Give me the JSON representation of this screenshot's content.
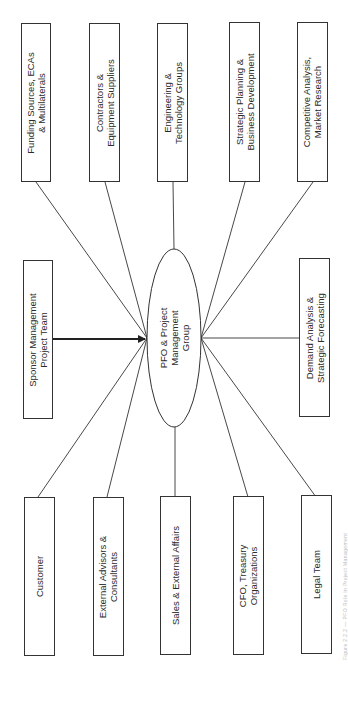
{
  "diagram": {
    "hub": {
      "label": "PFO & Project\nManagement\nGroup"
    },
    "top_nodes": [
      {
        "id": "funding",
        "label": "Funding Sources, ECAs\n& Multilaterals"
      },
      {
        "id": "contractors",
        "label": "Contractors &\nEquipment Suppliers"
      },
      {
        "id": "engineering",
        "label": "Engineering &\nTechnology Groups"
      },
      {
        "id": "strategic",
        "label": "Strategic Planning &\nBusiness Development"
      },
      {
        "id": "competitive",
        "label": "Competitive Analysis,\nMarket Research"
      }
    ],
    "middle_nodes": [
      {
        "id": "sponsor",
        "label": "Sponsor Management\nProject Team",
        "connection": "arrow-to-hub"
      },
      {
        "id": "demand",
        "label": "Demand Analysis &\nStrategic Forecasting",
        "connection": "line"
      }
    ],
    "bottom_nodes": [
      {
        "id": "customer",
        "label": "Customer"
      },
      {
        "id": "advisors",
        "label": "External Advisors &\nConsultants"
      },
      {
        "id": "sales",
        "label": "Sales & External Affairs"
      },
      {
        "id": "cfo",
        "label": "CFO, Treasury\nOrganizations"
      },
      {
        "id": "legal",
        "label": "Legal Team"
      }
    ],
    "caption": "Figure 2.2.2 — PFO Role in Project Management",
    "orientation": "rotated 90° counter-clockwise"
  },
  "colors": {
    "stroke": "#333333",
    "background": "#ffffff",
    "text": "#2a2a2a"
  }
}
